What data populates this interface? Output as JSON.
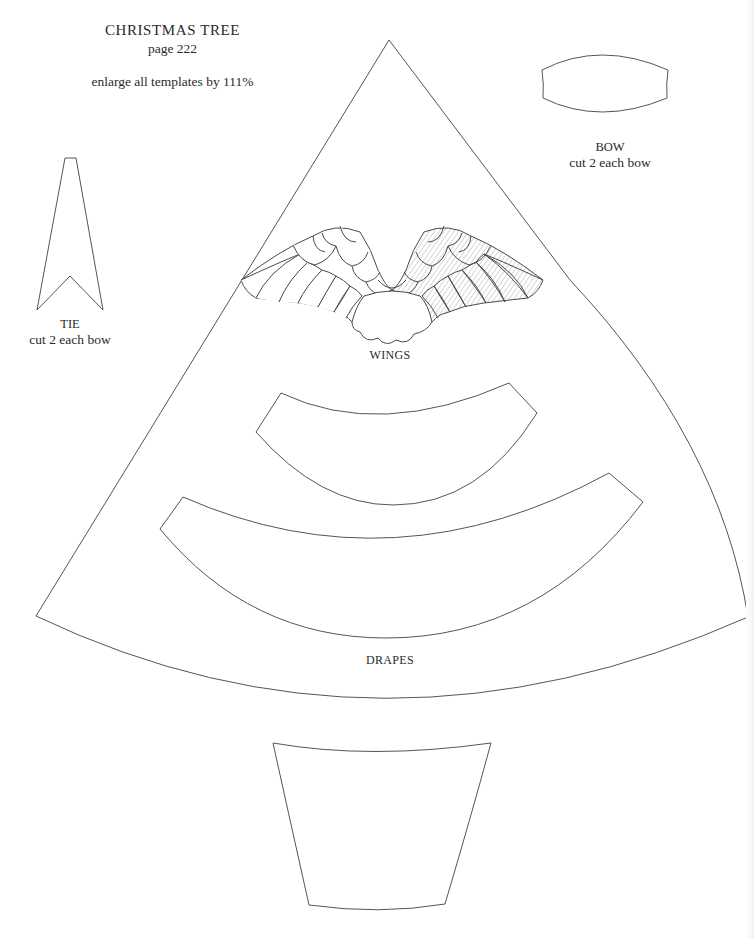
{
  "header": {
    "title": "CHRISTMAS TREE",
    "page_ref": "page 222",
    "instruction": "enlarge all templates by 111%"
  },
  "templates": {
    "tree": {
      "name": "tree-cone"
    },
    "bow": {
      "name": "BOW",
      "note": "cut 2 each bow"
    },
    "tie": {
      "name": "TIE",
      "note": "cut 2 each bow"
    },
    "wings": {
      "name": "WINGS"
    },
    "drapes": {
      "name": "DRAPES"
    },
    "pot": {
      "name": "pot"
    }
  },
  "colors": {
    "background": "#ffffff",
    "line": "#555555",
    "text": "#2a2a2a"
  }
}
